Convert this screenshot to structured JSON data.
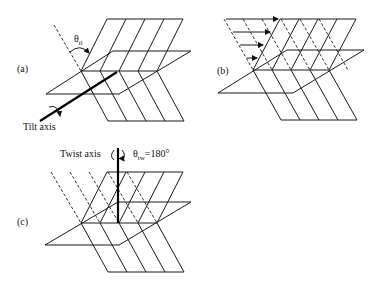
{
  "figure": {
    "panels": [
      {
        "id": "a",
        "label": "(a)",
        "axis_label": "Tilt axis",
        "angle_symbol": "θ",
        "angle_subscript": "tl"
      },
      {
        "id": "b",
        "label": "(b)"
      },
      {
        "id": "c",
        "label": "(c)",
        "axis_label": "Twist axis",
        "angle_symbol": "θ",
        "angle_subscript": "tw",
        "angle_value": "=180°"
      }
    ]
  }
}
